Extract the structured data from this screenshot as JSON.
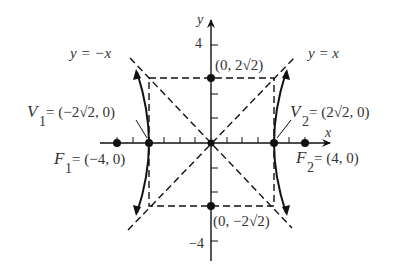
{
  "figure": {
    "type": "hyperbola",
    "equation_implied": "x^2/8 - y^2/8 = 1",
    "asymptotes": [
      {
        "id": "neg",
        "label": "y = −x"
      },
      {
        "id": "pos",
        "label": "y = x"
      }
    ],
    "axes": {
      "x_label": "x",
      "y_label": "y",
      "y_tick_top": "4",
      "y_tick_bottom": "−4"
    },
    "vertices": [
      {
        "name": "V",
        "sub": "1",
        "coords": " = (−2√2, 0)"
      },
      {
        "name": "V",
        "sub": "2",
        "coords": " = (2√2, 0)"
      }
    ],
    "foci": [
      {
        "name": "F",
        "sub": "1",
        "coords": " = (−4, 0)"
      },
      {
        "name": "F",
        "sub": "2",
        "coords": " = (4, 0)"
      }
    ],
    "points": [
      {
        "label": "(0, 2√2)"
      },
      {
        "label": "(0, −2√2)"
      }
    ],
    "colors": {
      "ink": "#111111",
      "text": "#333333",
      "background": "#ffffff"
    }
  }
}
